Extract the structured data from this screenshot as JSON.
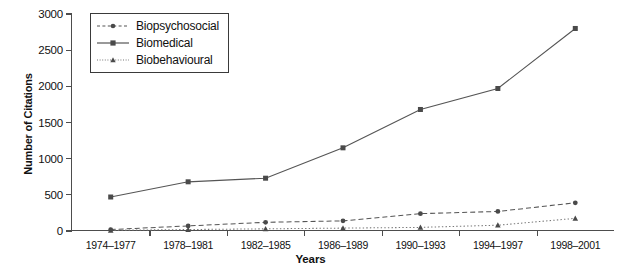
{
  "chart_data": {
    "type": "line",
    "title": "",
    "xlabel": "Years",
    "ylabel": "Number of Citations",
    "categories": [
      "1974–1977",
      "1978–1981",
      "1982–1985",
      "1986–1989",
      "1990–1993",
      "1994–1997",
      "1998–2001"
    ],
    "ylim": [
      0,
      3000
    ],
    "yticks": [
      0,
      500,
      1000,
      1500,
      2000,
      2500,
      3000
    ],
    "ytick_labels": [
      "0",
      "500",
      "1000",
      "1500",
      "2000",
      "2500",
      "3000"
    ],
    "grid": false,
    "legend_position": "top-left",
    "series": [
      {
        "name": "Biopsychosocial",
        "values": [
          20,
          70,
          120,
          140,
          240,
          270,
          390
        ],
        "line_style": "dashed",
        "marker": "circle",
        "color": "#555555"
      },
      {
        "name": "Biomedical",
        "values": [
          470,
          680,
          730,
          1150,
          1680,
          1970,
          2800
        ],
        "line_style": "solid",
        "marker": "square",
        "color": "#555555"
      },
      {
        "name": "Biobehavioural",
        "values": [
          10,
          20,
          30,
          40,
          50,
          80,
          175
        ],
        "line_style": "dotted",
        "marker": "triangle",
        "color": "#777777"
      }
    ]
  },
  "legend": {
    "items": [
      {
        "label": "Biopsychosocial"
      },
      {
        "label": "Biomedical"
      },
      {
        "label": "Biobehavioural"
      }
    ]
  },
  "axes": {
    "y_title": "Number of Citations",
    "x_title": "Years"
  }
}
